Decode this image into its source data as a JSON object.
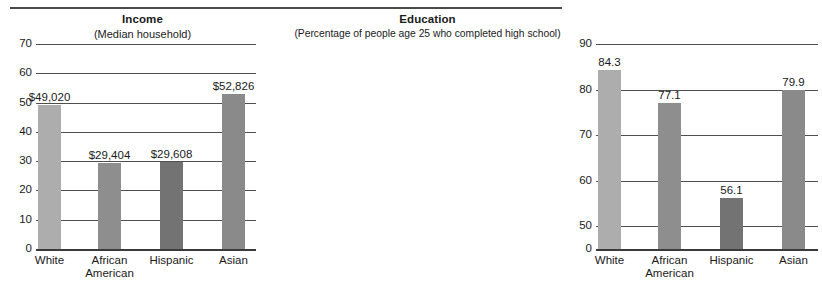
{
  "figure": {
    "has_top_rule": true
  },
  "chart_data": [
    {
      "id": "income",
      "type": "bar",
      "title": "Income",
      "subtitle": "(Median household)",
      "xlabel": "",
      "ylabel": "",
      "ylim": [
        0,
        70
      ],
      "yticks": [
        0,
        10,
        20,
        30,
        40,
        50,
        60,
        70
      ],
      "ytick_labels": [
        "0",
        "10",
        "20",
        "30",
        "40",
        "50",
        "60",
        "70"
      ],
      "grid": true,
      "legend": "none",
      "units": "thousands of dollars",
      "categories": [
        "White",
        "African American",
        "Hispanic",
        "Asian"
      ],
      "values": [
        49.02,
        29.404,
        29.608,
        52.826
      ],
      "data_labels": [
        "$49,020",
        "$29,404",
        "$29,608",
        "$52,826"
      ],
      "bar_colors": [
        "#adadad",
        "#8e8e8e",
        "#737373",
        "#8a8a8a"
      ]
    },
    {
      "id": "education",
      "type": "bar",
      "title": "Education",
      "subtitle": "(Percentage of people age 25 who completed high school)",
      "xlabel": "",
      "ylabel": "",
      "ylim": [
        45,
        90
      ],
      "yticks": [
        0,
        50,
        60,
        70,
        80,
        90
      ],
      "ytick_labels": [
        "0",
        "50",
        "60",
        "70",
        "80",
        "90"
      ],
      "axis_break": true,
      "grid": true,
      "legend": "none",
      "units": "percent",
      "categories": [
        "White",
        "African American",
        "Hispanic",
        "Asian"
      ],
      "values": [
        84.3,
        77.1,
        56.1,
        79.9
      ],
      "data_labels": [
        "84.3",
        "77.1",
        "56.1",
        "79.9"
      ],
      "bar_colors": [
        "#adadad",
        "#8e8e8e",
        "#737373",
        "#8a8a8a"
      ]
    }
  ],
  "colors": {
    "axis": "#4f4f4f",
    "text": "#1a1a1a",
    "background": "#ffffff",
    "rule": "#4a4a4a"
  }
}
